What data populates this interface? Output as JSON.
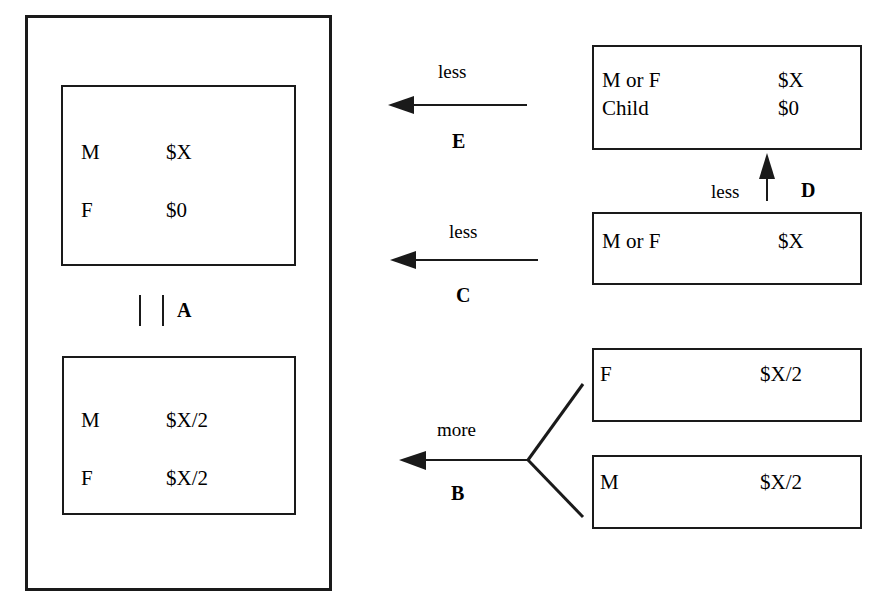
{
  "diagram": {
    "outer_container": {
      "name": "household-boundary"
    },
    "household_states": [
      {
        "id": "state-top",
        "rows": [
          {
            "label": "M",
            "value": "$X"
          },
          {
            "label": "F",
            "value": "$0"
          }
        ]
      },
      {
        "id": "state-bottom",
        "rows": [
          {
            "label": "M",
            "value": "$X/2"
          },
          {
            "label": "F",
            "value": "$X/2"
          }
        ]
      }
    ],
    "internal_link": {
      "tag": "A",
      "symbol": "parallel-bars"
    },
    "external_boxes": [
      {
        "id": "box-e",
        "rows": [
          {
            "label": "M or F",
            "value": "$X"
          },
          {
            "label": "Child",
            "value": "$0"
          }
        ]
      },
      {
        "id": "box-c",
        "rows": [
          {
            "label": "M or F",
            "value": "$X"
          }
        ]
      },
      {
        "id": "box-b-upper",
        "rows": [
          {
            "label": "F",
            "value": "$X/2"
          }
        ]
      },
      {
        "id": "box-b-lower",
        "rows": [
          {
            "label": "M",
            "value": "$X/2"
          }
        ]
      }
    ],
    "arrows": [
      {
        "id": "arrow-e",
        "tag": "E",
        "qualifier": "less",
        "direction": "left"
      },
      {
        "id": "arrow-d",
        "tag": "D",
        "qualifier": "less",
        "direction": "up"
      },
      {
        "id": "arrow-c",
        "tag": "C",
        "qualifier": "less",
        "direction": "left"
      },
      {
        "id": "arrow-b",
        "tag": "B",
        "qualifier": "more",
        "direction": "left-fork"
      }
    ],
    "colors": {
      "ink": "#1a1a1a",
      "background": "#ffffff"
    }
  }
}
